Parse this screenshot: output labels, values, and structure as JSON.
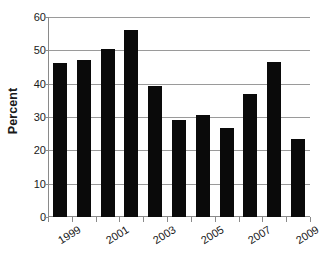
{
  "chart_data": {
    "type": "bar",
    "title": "",
    "subtitle": "",
    "xlabel": "",
    "ylabel": "Percent",
    "categories": [
      "1999",
      "2000",
      "2001",
      "2002",
      "2003",
      "2004",
      "2005",
      "2006",
      "2007",
      "2008",
      "2009"
    ],
    "values": [
      46.2,
      47.0,
      50.4,
      56.1,
      39.4,
      29.2,
      30.7,
      26.8,
      36.8,
      46.5,
      23.4
    ],
    "ylim": [
      0,
      60
    ],
    "ytick_labels": [
      "0",
      "10",
      "20",
      "30",
      "40",
      "50",
      "60"
    ],
    "ytick_values": [
      0,
      10,
      20,
      30,
      40,
      50,
      60
    ],
    "xtick_labels_shown": [
      "1999",
      "2001",
      "2003",
      "2005",
      "2007",
      "2009"
    ],
    "grid": "horizontal",
    "legend": "none",
    "bar_color": "#0a0a0a",
    "gridline_color": "#9a9a9a",
    "axis_color": "#8a8a8a",
    "background_color": "#ffffff",
    "xtick_label_rotation": "-32deg"
  }
}
